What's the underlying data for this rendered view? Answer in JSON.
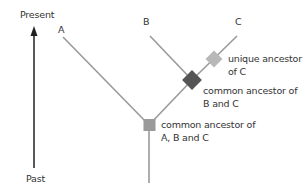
{
  "time_axis": {
    "top_label": "Present",
    "bottom_label": "Past"
  },
  "taxa": [
    {
      "id": "A",
      "label": "A"
    },
    {
      "id": "B",
      "label": "B"
    },
    {
      "id": "C",
      "label": "C"
    }
  ],
  "nodes": {
    "unique_c": {
      "line1": "unique ancestor",
      "line2": "of C",
      "color": "#b8b8b8"
    },
    "common_bc": {
      "line1": "common ancestor of",
      "line2": "B and C",
      "color": "#555555"
    },
    "common_abc": {
      "line1": "common ancestor of",
      "line2": "A, B and C",
      "color": "#9a9a9a"
    }
  },
  "colors": {
    "branch": "#9a9a9a",
    "axis": "#222222",
    "text": "#333333"
  }
}
